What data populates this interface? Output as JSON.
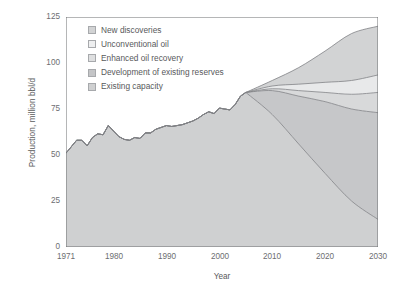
{
  "chart_data": {
    "type": "area",
    "stacked": true,
    "title": "",
    "xlabel": "Year",
    "ylabel": "Production, million bbl/d",
    "xlim": [
      1971,
      2030
    ],
    "ylim": [
      0,
      125
    ],
    "yticks": [
      0,
      25,
      50,
      75,
      100,
      125
    ],
    "xticks": [
      1971,
      1980,
      1990,
      2000,
      2010,
      2020,
      2030
    ],
    "grid": false,
    "legend_position": "top-left inside plot",
    "history_end_year": 2005,
    "x": [
      1971,
      1972,
      1973,
      1974,
      1975,
      1976,
      1977,
      1978,
      1979,
      1980,
      1981,
      1982,
      1983,
      1984,
      1985,
      1986,
      1987,
      1988,
      1989,
      1990,
      1991,
      1992,
      1993,
      1994,
      1995,
      1996,
      1997,
      1998,
      1999,
      2000,
      2001,
      2002,
      2003,
      2004,
      2005,
      2010,
      2015,
      2020,
      2025,
      2030
    ],
    "series": [
      {
        "name": "Existing capacity",
        "color": "#cfd0d1",
        "values": [
          51.0,
          54.5,
          58.0,
          58.0,
          55.0,
          59.5,
          61.5,
          61.0,
          66.0,
          63.0,
          60.0,
          58.5,
          58.0,
          59.5,
          59.0,
          62.0,
          62.0,
          64.0,
          65.0,
          66.0,
          65.5,
          66.0,
          66.5,
          67.5,
          68.5,
          70.0,
          72.0,
          73.5,
          72.5,
          75.5,
          75.0,
          74.5,
          77.5,
          82.0,
          84.0,
          72.0,
          56.0,
          40.0,
          25.0,
          15.0
        ]
      },
      {
        "name": "Development of existing reserves",
        "color": "#c6c7c9",
        "values": [
          0,
          0,
          0,
          0,
          0,
          0,
          0,
          0,
          0,
          0,
          0,
          0,
          0,
          0,
          0,
          0,
          0,
          0,
          0,
          0,
          0,
          0,
          0,
          0,
          0,
          0,
          0,
          0,
          0,
          0,
          0,
          0,
          0,
          0,
          0,
          13.0,
          26.0,
          39.0,
          50.0,
          58.0
        ]
      },
      {
        "name": "Enhanced oil recovery",
        "color": "#d8d9da",
        "values": [
          0,
          0,
          0,
          0,
          0,
          0,
          0,
          0,
          0,
          0,
          0,
          0,
          0,
          0,
          0,
          0,
          0,
          0,
          0,
          0,
          0,
          0,
          0,
          0,
          0,
          0,
          0,
          0,
          0,
          0,
          0,
          0,
          0,
          0,
          0,
          1.0,
          3.0,
          5.0,
          8.0,
          11.0
        ]
      },
      {
        "name": "Unconventional oil",
        "color": "#e8e9ea",
        "values": [
          0,
          0,
          0,
          0,
          0,
          0,
          0,
          0,
          0,
          0,
          0,
          0,
          0,
          0,
          0,
          0,
          0,
          0,
          0,
          0,
          0,
          0,
          0,
          0,
          0,
          0,
          0,
          0,
          0,
          0,
          0,
          0,
          0,
          0,
          0,
          1.5,
          3.5,
          5.5,
          7.5,
          9.5
        ]
      },
      {
        "name": "New discoveries",
        "color": "#d2d3d4",
        "values": [
          0,
          0,
          0,
          0,
          0,
          0,
          0,
          0,
          0,
          0,
          0,
          0,
          0,
          0,
          0,
          0,
          0,
          0,
          0,
          0,
          0,
          0,
          0,
          0,
          0,
          0,
          0,
          0,
          0,
          0,
          0,
          0,
          0,
          0,
          0,
          3.0,
          9.0,
          17.0,
          25.5,
          26.5
        ]
      }
    ],
    "totals": {
      "2005": 84.0,
      "2010": 90.5,
      "2015": 97.5,
      "2020": 106.5,
      "2025": 116.0,
      "2030": 120.0
    }
  },
  "legend": {
    "items": [
      {
        "label": "New discoveries",
        "color": "#d2d3d4"
      },
      {
        "label": "Unconventional oil",
        "color": "#eeeff0"
      },
      {
        "label": "Enhanced oil recovery",
        "color": "#dedfe0"
      },
      {
        "label": "Development of existing reserves",
        "color": "#c4c5c7"
      },
      {
        "label": "Existing capacity",
        "color": "#cfd0d1"
      }
    ]
  },
  "axes": {
    "y_title": "Production, million bbl/d",
    "x_title": "Year",
    "y_tick_labels": [
      "0",
      "25",
      "50",
      "75",
      "100",
      "125"
    ],
    "x_tick_labels": [
      "1971",
      "1980",
      "1990",
      "2000",
      "2010",
      "2020",
      "2030"
    ]
  },
  "colors": {
    "axis": "#6d6e71",
    "text": "#58595b",
    "line": "#808285"
  }
}
